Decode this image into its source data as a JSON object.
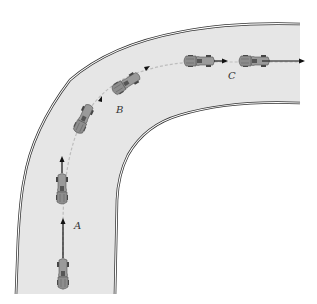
{
  "figure": {
    "top_caption_partial": "",
    "labels": {
      "A": "A",
      "B": "B",
      "C": "C"
    },
    "road": {
      "fill": "#e8e8e8",
      "edge": "#333333"
    },
    "car": {
      "body": "#8a8a8a",
      "dark": "#555555",
      "arrow": "#111111"
    }
  }
}
